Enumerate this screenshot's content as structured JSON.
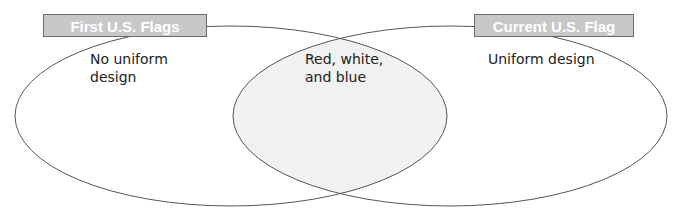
{
  "diagram": {
    "type": "venn",
    "left_set": {
      "title": "First U.S. Flags",
      "items": [
        "No uniform design"
      ]
    },
    "right_set": {
      "title": "Current U.S. Flag",
      "items": [
        "Uniform design"
      ]
    },
    "overlap": {
      "items": [
        "Red, white, and blue"
      ]
    }
  },
  "texts": {
    "left_line1": "No uniform",
    "left_line2": "design",
    "overlap_line1": "Red, white,",
    "overlap_line2": "and blue",
    "right_line1": "Uniform design"
  },
  "colors": {
    "overlap_fill": "#f1f1f1",
    "outline": "#555555",
    "label_bg": "#c8c8c8",
    "label_text": "#ffffff"
  }
}
